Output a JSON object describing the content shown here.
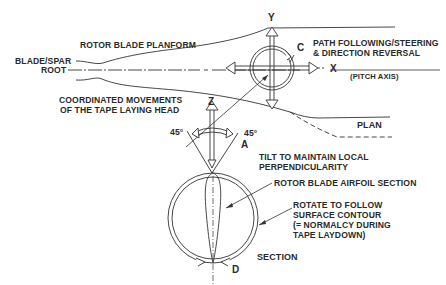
{
  "diagram": {
    "labels": {
      "rotor_blade_planform": "ROTOR BLADE PLANFORM",
      "blade_spar": "BLADE/SPAR",
      "root": "ROOT",
      "coordinated_1": "COORDINATED MOVEMENTS",
      "coordinated_2": "OF THE TAPE LAYING HEAD",
      "path_following_1": "PATH FOLLOWING/STEERING",
      "path_following_2": "& DIRECTION REVERSAL",
      "pitch_axis": "(PITCH AXIS)",
      "plan": "PLAN",
      "tilt_1": "TILT TO MAINTAIN LOCAL",
      "tilt_2": "PERPENDICULARITY",
      "airfoil_section": "ROTOR BLADE AIRFOIL SECTION",
      "rotate_1": "ROTATE TO FOLLOW",
      "rotate_2": "SURFACE CONTOUR",
      "rotate_3": "(= NORMALCY DURING",
      "rotate_4": "TAPE LAYDOWN)",
      "section": "SECTION"
    },
    "axes": {
      "y": "Y",
      "x": "X",
      "z": "Z",
      "c": "C",
      "a": "A",
      "d": "D"
    },
    "angles": {
      "left": "45°",
      "right": "45°"
    },
    "colors": {
      "line": "#2a2a2a",
      "background": "#ffffff"
    }
  }
}
